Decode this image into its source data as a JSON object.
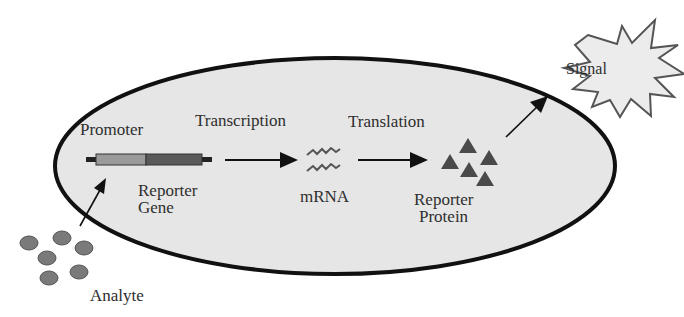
{
  "diagram": {
    "cell": {
      "fill": "#e6e6e6",
      "stroke": "#111111"
    },
    "labels": {
      "promoter": "Promoter",
      "transcription": "Transcription",
      "translation": "Translation",
      "reporter_gene": [
        "Reporter",
        "Gene"
      ],
      "mrna": "mRNA",
      "reporter_protein": [
        "Reporter",
        "Protein"
      ],
      "signal": "Signal",
      "analyte": "Analyte"
    },
    "gene_segments": [
      {
        "name": "promoter",
        "color": "#9a9a9a"
      },
      {
        "name": "reporter-gene",
        "color": "#5a5a5a"
      }
    ],
    "analyte_color": "#7a7a7a",
    "protein_color": "#4a4a4a",
    "caption": "blurred source caption"
  }
}
